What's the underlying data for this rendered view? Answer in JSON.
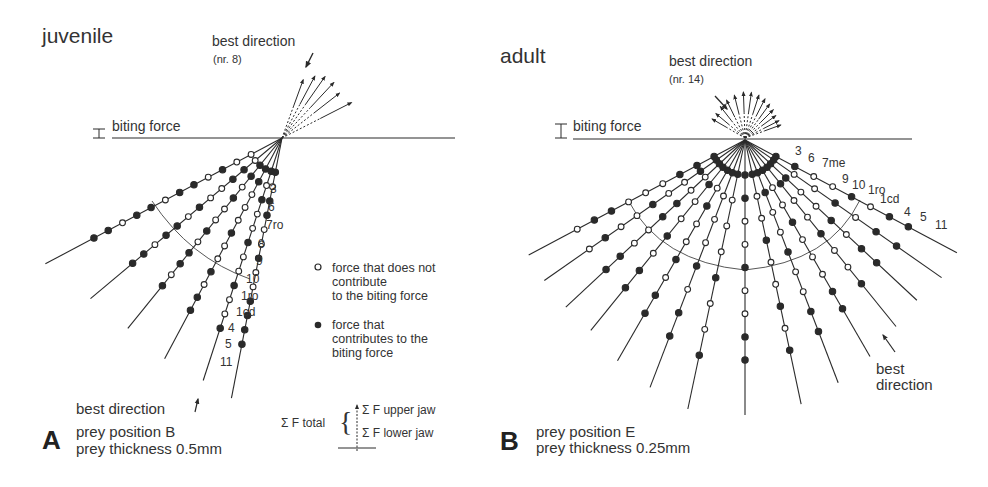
{
  "figure": {
    "panels": [
      {
        "id": "A",
        "letter": "A",
        "title": "juvenile",
        "best_direction_label": "best direction",
        "best_direction_nr": "(nr. 8)",
        "biting_force_label": "biting force",
        "bottom_best_direction": "best direction",
        "prey_position": "prey position B",
        "prey_thickness": "prey thickness 0.5mm",
        "ray_labels": [
          "3",
          "6",
          "7ro",
          "8",
          "9",
          "10",
          "1ro",
          "1cd",
          "4",
          "5",
          "11"
        ]
      },
      {
        "id": "B",
        "letter": "B",
        "title": "adult",
        "best_direction_label": "best direction",
        "best_direction_nr": "(nr. 14)",
        "biting_force_label": "biting force",
        "side_best_direction": [
          "best",
          "direction"
        ],
        "prey_position": "prey position E",
        "prey_thickness": "prey thickness 0.25mm",
        "ray_labels": [
          "3",
          "6",
          "7me",
          "9",
          "10",
          "1ro",
          "1cd",
          "4",
          "5",
          "11"
        ]
      }
    ],
    "legend": {
      "open_circle": [
        "force that does not",
        "contribute",
        "to the biting force"
      ],
      "filled_circle": [
        "force that",
        "contributes to the",
        "biting force"
      ],
      "sigma_total": "Σ F total",
      "sigma_upper": "Σ F upper jaw",
      "sigma_lower": "Σ F lower jaw"
    },
    "colors": {
      "ink": "#2a2a2a",
      "paper": "#ffffff"
    },
    "rays": {
      "A": {
        "apex": [
          282,
          138
        ],
        "angles_deg": [
          152,
          140,
          129,
          118,
          108,
          101
        ],
        "lengths": [
          268,
          250,
          245,
          250,
          255,
          265
        ],
        "patterns": [
          "oofoffoffoff",
          "offoofoffoff",
          "ffofoofoffof",
          "ffooofoofoff",
          "fofoofoofoof",
          "foffoofooffff"
        ]
      },
      "B": {
        "apex": [
          745,
          140
        ],
        "angles_deg": [
          152,
          145,
          137,
          129,
          120,
          111,
          102,
          90,
          78,
          69,
          60,
          51,
          43,
          35,
          28
        ],
        "lengths": [
          245,
          245,
          245,
          245,
          255,
          265,
          275,
          275,
          270,
          260,
          250,
          240,
          235,
          240,
          240
        ]
      },
      "A_arrows": {
        "origin": [
          282,
          138
        ],
        "angles_deg": [
          70,
          62,
          55,
          47,
          38,
          27
        ],
        "lengths": [
          62,
          70,
          75,
          76,
          73,
          78
        ]
      },
      "B_arrows": {
        "origin": [
          745,
          138
        ],
        "angles_deg": [
          150,
          140,
          128,
          116,
          104,
          92,
          82,
          72,
          63,
          54,
          45,
          36,
          27,
          20
        ],
        "lengths": [
          38,
          38,
          40,
          42,
          44,
          46,
          46,
          45,
          44,
          42,
          40,
          38,
          38,
          38
        ]
      }
    }
  }
}
